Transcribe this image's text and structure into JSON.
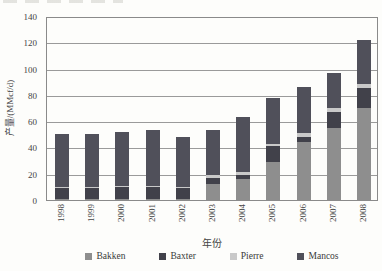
{
  "figure": {
    "background": "#fdfdfb",
    "note": ""
  },
  "chart_data": {
    "type": "bar",
    "stacked": true,
    "title": "",
    "xlabel": "年份",
    "ylabel": "产量/(MMcf/d)",
    "ylim": [
      0,
      140
    ],
    "ytick_step": 20,
    "grid": "horizontal",
    "legend_position": "bottom",
    "categories": [
      "1998",
      "1999",
      "2000",
      "2001",
      "2002",
      "2003",
      "2004",
      "2005",
      "2006",
      "2007",
      "2008"
    ],
    "series": [
      {
        "name": "Bakken",
        "color": "#8e8e8e",
        "values": [
          1,
          1,
          1,
          1,
          1,
          12,
          16,
          29,
          44,
          55,
          70
        ]
      },
      {
        "name": "Baxter",
        "color": "#41414a",
        "values": [
          8,
          8,
          9,
          9,
          8,
          5,
          3,
          12,
          4,
          12,
          15
        ]
      },
      {
        "name": "Pierre",
        "color": "#c9c9c9",
        "values": [
          1,
          1,
          1,
          1,
          1,
          2,
          2,
          2,
          3,
          3,
          3
        ]
      },
      {
        "name": "Mancos",
        "color": "#50505a",
        "values": [
          40,
          40,
          41,
          42,
          38,
          34,
          42,
          35,
          35,
          27,
          34
        ]
      }
    ],
    "totals": [
      50,
      50,
      52,
      53,
      48,
      53,
      63,
      78,
      86,
      97,
      122
    ]
  }
}
